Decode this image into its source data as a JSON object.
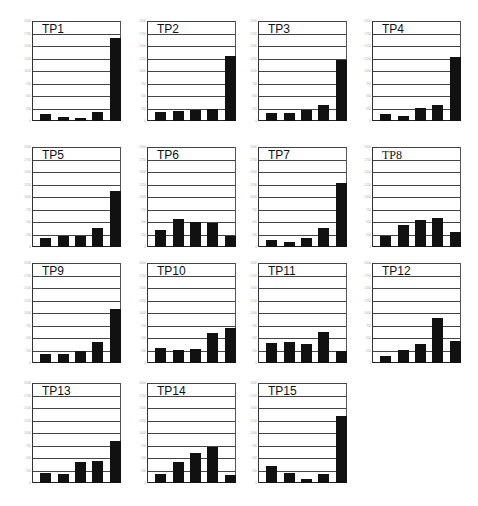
{
  "chart_data": [
    {
      "type": "bar",
      "title": "TP1",
      "categories": [
        "1",
        "2",
        "3",
        "4",
        "5"
      ],
      "values": [
        135,
        90,
        55,
        180,
        1670
      ],
      "ylim": [
        0,
        2000
      ],
      "yticks": [
        0,
        250,
        500,
        750,
        1000,
        1250,
        1500,
        1750,
        2000
      ],
      "grid": true
    },
    {
      "type": "bar",
      "title": "TP2",
      "categories": [
        "1",
        "2",
        "3",
        "4",
        "5"
      ],
      "values": [
        180,
        200,
        220,
        245,
        1305
      ],
      "ylim": [
        0,
        2000
      ],
      "yticks": [
        0,
        250,
        500,
        750,
        1000,
        1250,
        1500,
        1750,
        2000
      ],
      "grid": true
    },
    {
      "type": "bar",
      "title": "TP3",
      "categories": [
        "1",
        "2",
        "3",
        "4",
        "5"
      ],
      "values": [
        165,
        160,
        230,
        330,
        1230
      ],
      "ylim": [
        0,
        2000
      ],
      "yticks": [
        0,
        250,
        500,
        750,
        1000,
        1250,
        1500,
        1750,
        2000
      ],
      "grid": true
    },
    {
      "type": "bar",
      "title": "TP4",
      "categories": [
        "1",
        "2",
        "3",
        "4",
        "5"
      ],
      "values": [
        150,
        110,
        260,
        325,
        1285
      ],
      "ylim": [
        0,
        2000
      ],
      "yticks": [
        0,
        250,
        500,
        750,
        1000,
        1250,
        1500,
        1750,
        2000
      ],
      "grid": true
    },
    {
      "type": "bar",
      "title": "TP5",
      "categories": [
        "1",
        "2",
        "3",
        "4",
        "5"
      ],
      "values": [
        175,
        215,
        230,
        375,
        1130
      ],
      "ylim": [
        0,
        2000
      ],
      "yticks": [
        0,
        250,
        500,
        750,
        1000,
        1250,
        1500,
        1750,
        2000
      ],
      "grid": true
    },
    {
      "type": "bar",
      "title": "TP6",
      "categories": [
        "1",
        "2",
        "3",
        "4",
        "5"
      ],
      "values": [
        345,
        555,
        510,
        490,
        230
      ],
      "ylim": [
        0,
        2000
      ],
      "yticks": [
        0,
        250,
        500,
        750,
        1000,
        1250,
        1500,
        1750,
        2000
      ],
      "grid": true
    },
    {
      "type": "bar",
      "title": "TP7",
      "categories": [
        "1",
        "2",
        "3",
        "4",
        "5"
      ],
      "values": [
        140,
        95,
        180,
        380,
        1285
      ],
      "ylim": [
        0,
        2000
      ],
      "yticks": [
        0,
        250,
        500,
        750,
        1000,
        1250,
        1500,
        1750,
        2000
      ],
      "grid": true
    },
    {
      "type": "bar",
      "title": "TP8",
      "categories": [
        "1",
        "2",
        "3",
        "4",
        "5"
      ],
      "values": [
        220,
        450,
        540,
        590,
        310
      ],
      "ylim": [
        0,
        2000
      ],
      "yticks": [
        0,
        250,
        500,
        750,
        1000,
        1250,
        1500,
        1750,
        2000
      ],
      "grid": true
    },
    {
      "type": "bar",
      "title": "TP9",
      "categories": [
        "1",
        "2",
        "3",
        "4",
        "5"
      ],
      "values": [
        180,
        180,
        240,
        420,
        1090
      ],
      "ylim": [
        0,
        2000
      ],
      "yticks": [
        0,
        250,
        500,
        750,
        1000,
        1250,
        1500,
        1750,
        2000
      ],
      "grid": true
    },
    {
      "type": "bar",
      "title": "TP10",
      "categories": [
        "1",
        "2",
        "3",
        "4",
        "5"
      ],
      "values": [
        300,
        260,
        280,
        600,
        705
      ],
      "ylim": [
        0,
        2000
      ],
      "yticks": [
        0,
        250,
        500,
        750,
        1000,
        1250,
        1500,
        1750,
        2000
      ],
      "grid": true
    },
    {
      "type": "bar",
      "title": "TP11",
      "categories": [
        "1",
        "2",
        "3",
        "4",
        "5"
      ],
      "values": [
        400,
        420,
        380,
        625,
        245
      ],
      "ylim": [
        0,
        2000
      ],
      "yticks": [
        0,
        250,
        500,
        750,
        1000,
        1250,
        1500,
        1750,
        2000
      ],
      "grid": true
    },
    {
      "type": "bar",
      "title": "TP12",
      "categories": [
        "1",
        "2",
        "3",
        "4",
        "5"
      ],
      "values": [
        135,
        260,
        380,
        895,
        435
      ],
      "ylim": [
        0,
        2000
      ],
      "yticks": [
        0,
        250,
        500,
        750,
        1000,
        1250,
        1500,
        1750,
        2000
      ],
      "grid": true
    },
    {
      "type": "bar",
      "title": "TP13",
      "categories": [
        "1",
        "2",
        "3",
        "4",
        "5"
      ],
      "values": [
        205,
        180,
        415,
        450,
        850
      ],
      "ylim": [
        0,
        2000
      ],
      "yticks": [
        0,
        250,
        500,
        750,
        1000,
        1250,
        1500,
        1750,
        2000
      ],
      "grid": true
    },
    {
      "type": "bar",
      "title": "TP14",
      "categories": [
        "1",
        "2",
        "3",
        "4",
        "5"
      ],
      "values": [
        185,
        430,
        605,
        725,
        170
      ],
      "ylim": [
        0,
        2000
      ],
      "yticks": [
        0,
        250,
        500,
        750,
        1000,
        1250,
        1500,
        1750,
        2000
      ],
      "grid": true
    },
    {
      "type": "bar",
      "title": "TP15",
      "categories": [
        "1",
        "2",
        "3",
        "4",
        "5"
      ],
      "values": [
        345,
        195,
        85,
        180,
        1340
      ],
      "ylim": [
        0,
        2000
      ],
      "yticks": [
        0,
        250,
        500,
        750,
        1000,
        1250,
        1500,
        1750,
        2000
      ],
      "grid": true
    }
  ],
  "layout": {
    "columns_x": [
      14,
      129,
      240,
      354
    ],
    "rows_y": [
      15,
      141,
      257,
      377
    ],
    "bar_color": "#111111",
    "grid_color": "#444444"
  }
}
